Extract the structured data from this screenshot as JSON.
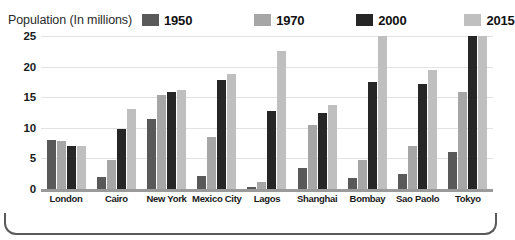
{
  "legend": {
    "title": "Population (In millions)",
    "entries": [
      {
        "label": "1950",
        "color": "#595959"
      },
      {
        "label": "1970",
        "color": "#a6a6a6"
      },
      {
        "label": "2000",
        "color": "#262626"
      },
      {
        "label": "2015",
        "color": "#bfbfbf"
      }
    ]
  },
  "axis": {
    "y_ticks": [
      "25",
      "20",
      "15",
      "10",
      "5",
      "0"
    ]
  },
  "chart_data": {
    "type": "bar",
    "title": "Population (In millions)",
    "xlabel": "",
    "ylabel": "Population (In millions)",
    "ylim": [
      0,
      25
    ],
    "ygrid": true,
    "legend_position": "top",
    "categories": [
      "London",
      "Cairo",
      "New York",
      "Mexico City",
      "Lagos",
      "Shanghai",
      "Bombay",
      "Sao Paolo",
      "Tokyo"
    ],
    "series": [
      {
        "name": "1950",
        "color": "#595959",
        "values": [
          8.0,
          2.0,
          11.5,
          2.2,
          0.3,
          3.5,
          1.8,
          2.5,
          6.0
        ]
      },
      {
        "name": "1970",
        "color": "#a6a6a6",
        "values": [
          7.8,
          4.8,
          15.3,
          8.5,
          1.2,
          10.5,
          4.8,
          7.0,
          15.8
        ]
      },
      {
        "name": "2000",
        "color": "#262626",
        "values": [
          7.0,
          9.8,
          15.8,
          17.8,
          12.7,
          12.5,
          17.5,
          17.2,
          25.0
        ]
      },
      {
        "name": "2015",
        "color": "#bfbfbf",
        "values": [
          7.0,
          13.0,
          16.2,
          18.8,
          22.5,
          13.8,
          25.0,
          19.5,
          25.0
        ]
      }
    ]
  }
}
